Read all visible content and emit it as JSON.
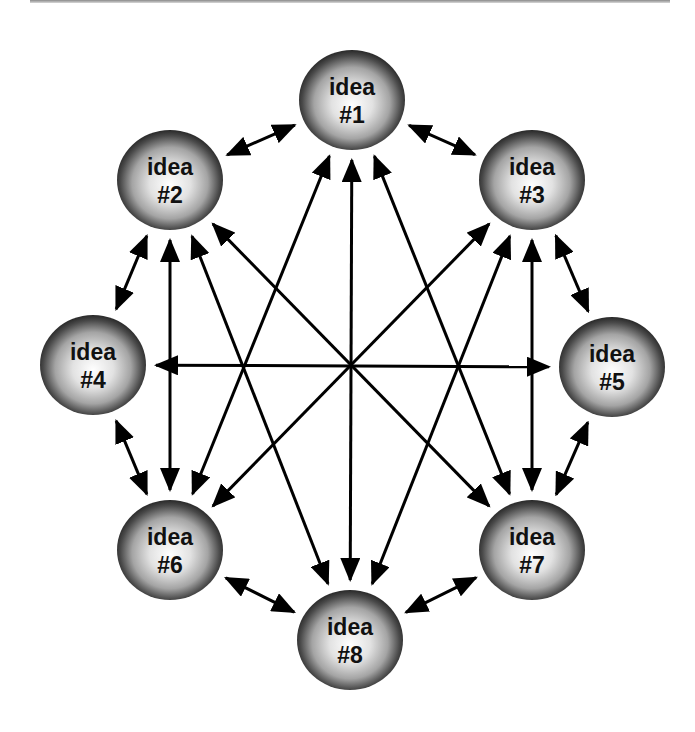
{
  "diagram": {
    "type": "fully-connected idea network",
    "colors": {
      "background": "#ffffff",
      "line": "#000000",
      "sphere_highlight": "#ffffff",
      "sphere_mid": "#a8a8a8",
      "sphere_edge": "#1a1a1a",
      "label": "#111111"
    },
    "nodes": [
      {
        "id": "1",
        "line1": "idea",
        "line2": "#1",
        "cx": 352,
        "cy": 100
      },
      {
        "id": "2",
        "line1": "idea",
        "line2": "#2",
        "cx": 170,
        "cy": 180
      },
      {
        "id": "3",
        "line1": "idea",
        "line2": "#3",
        "cx": 532,
        "cy": 180
      },
      {
        "id": "4",
        "line1": "idea",
        "line2": "#4",
        "cx": 93,
        "cy": 365
      },
      {
        "id": "5",
        "line1": "idea",
        "line2": "#5",
        "cx": 612,
        "cy": 367
      },
      {
        "id": "6",
        "line1": "idea",
        "line2": "#6",
        "cx": 170,
        "cy": 550
      },
      {
        "id": "7",
        "line1": "idea",
        "line2": "#7",
        "cx": 532,
        "cy": 550
      },
      {
        "id": "8",
        "line1": "idea",
        "line2": "#8",
        "cx": 350,
        "cy": 640
      }
    ],
    "edges": [
      {
        "from": "1",
        "to": "2",
        "bidirectional": true
      },
      {
        "from": "1",
        "to": "3",
        "bidirectional": true
      },
      {
        "from": "2",
        "to": "4",
        "bidirectional": true
      },
      {
        "from": "3",
        "to": "5",
        "bidirectional": true
      },
      {
        "from": "4",
        "to": "6",
        "bidirectional": true
      },
      {
        "from": "5",
        "to": "7",
        "bidirectional": true
      },
      {
        "from": "6",
        "to": "8",
        "bidirectional": true
      },
      {
        "from": "7",
        "to": "8",
        "bidirectional": true
      },
      {
        "from": "1",
        "to": "8",
        "bidirectional": true
      },
      {
        "from": "4",
        "to": "5",
        "bidirectional": true
      },
      {
        "from": "2",
        "to": "6",
        "bidirectional": true
      },
      {
        "from": "3",
        "to": "7",
        "bidirectional": true
      },
      {
        "from": "2",
        "to": "7",
        "bidirectional": true
      },
      {
        "from": "3",
        "to": "6",
        "bidirectional": true
      },
      {
        "from": "1",
        "to": "6",
        "bidirectional": false,
        "arrows_at": [
          "1",
          "6"
        ]
      },
      {
        "from": "1",
        "to": "7",
        "bidirectional": false,
        "arrows_at": [
          "1",
          "7"
        ]
      },
      {
        "from": "2",
        "to": "8",
        "bidirectional": false,
        "arrows_at": [
          "2",
          "8"
        ]
      },
      {
        "from": "3",
        "to": "8",
        "bidirectional": false,
        "arrows_at": [
          "3",
          "8"
        ]
      }
    ]
  }
}
